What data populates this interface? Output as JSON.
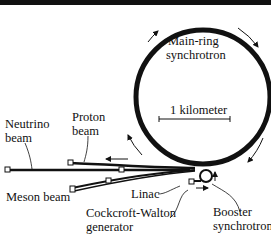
{
  "labels": {
    "main_ring_line1": "Main-ring",
    "main_ring_line2": "synchrotron",
    "scale": "1 kilometer",
    "neutrino_line1": "Neutrino",
    "neutrino_line2": "beam",
    "proton_line1": "Proton",
    "proton_line2": "beam",
    "meson": "Meson beam",
    "linac": "Linac",
    "cw_line1": "Cockcroft-Walton",
    "cw_line2": "generator",
    "booster_line1": "Booster",
    "booster_line2": "synchrotron"
  },
  "colors": {
    "ink": "#111111",
    "background": "#ffffff"
  }
}
